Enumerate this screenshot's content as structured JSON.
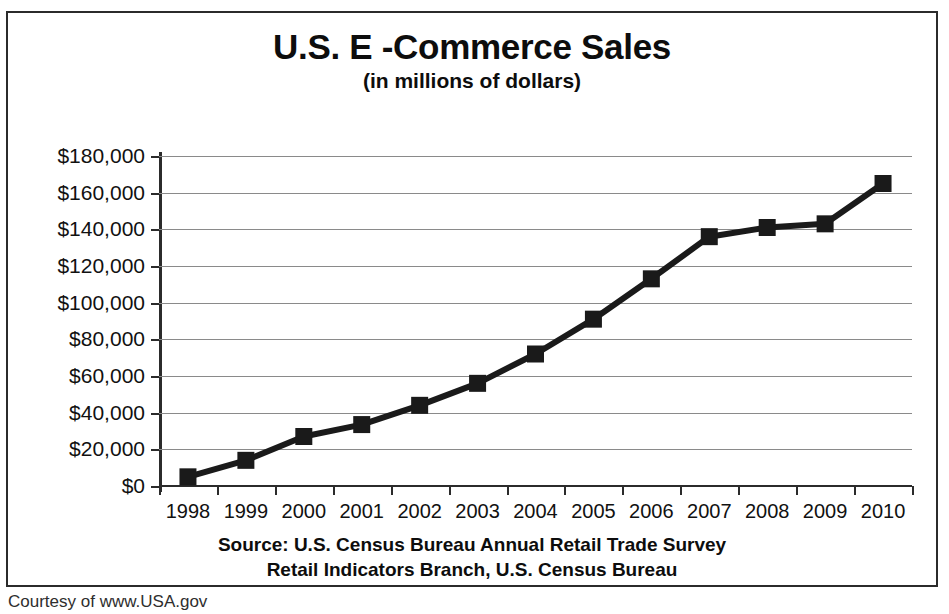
{
  "chart_data": {
    "type": "line",
    "title": "U.S. E -Commerce Sales",
    "subtitle": "(in millions of dollars)",
    "xlabel": "",
    "ylabel": "",
    "categories": [
      "1998",
      "1999",
      "2000",
      "2001",
      "2002",
      "2003",
      "2004",
      "2005",
      "2006",
      "2007",
      "2008",
      "2009",
      "2010"
    ],
    "values": [
      5000,
      14000,
      27000,
      33500,
      44000,
      56000,
      72000,
      91000,
      113000,
      136000,
      141000,
      143000,
      165000
    ],
    "ylim": [
      0,
      180000
    ],
    "y_ticks": [
      0,
      20000,
      40000,
      60000,
      80000,
      100000,
      120000,
      140000,
      160000,
      180000
    ],
    "y_tick_labels": [
      "$0",
      "$20,000",
      "$40,000",
      "$60,000",
      "$80,000",
      "$100,000",
      "$120,000",
      "$140,000",
      "$160,000",
      "$180,000"
    ],
    "grid": true,
    "legend": "none",
    "marker": "square",
    "series_color": "#1a1a1a",
    "grid_color": "#8a8a8a",
    "axis_color": "#2b2b2b"
  },
  "source": {
    "line1": "Source: U.S. Census Bureau Annual Retail Trade Survey",
    "line2": "Retail Indicators Branch, U.S. Census Bureau"
  },
  "footer": {
    "courtesy": "Courtesy of www.USA.gov"
  }
}
